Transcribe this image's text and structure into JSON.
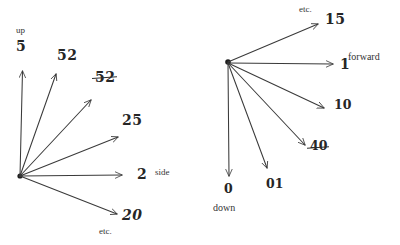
{
  "figure": {
    "background_color": "#ffffff",
    "ink_color": "#2e2e2e",
    "stroke_color": "#3a3a3a"
  },
  "left_diagram": {
    "name": "side-up-fan",
    "origin_label_up": "up",
    "origin_label_side": "side",
    "etc_label": "etc.",
    "axis_labels": {
      "up": "up",
      "side": "side"
    },
    "rays": [
      {
        "id": "ray-up",
        "label": "5",
        "struck": false
      },
      {
        "id": "ray-upper-1",
        "label": "52",
        "struck": false
      },
      {
        "id": "ray-upper-2",
        "label": "52",
        "struck": true
      },
      {
        "id": "ray-mid",
        "label": "25",
        "struck": false
      },
      {
        "id": "ray-side",
        "label": "2",
        "struck": false
      },
      {
        "id": "ray-lower",
        "label": "20",
        "struck": false
      }
    ]
  },
  "right_diagram": {
    "name": "forward-down-fan",
    "etc_label": "etc.",
    "axis_labels": {
      "forward": "forward",
      "down": "down"
    },
    "rays": [
      {
        "id": "ray-up-right",
        "label": "15",
        "struck": false
      },
      {
        "id": "ray-forward",
        "label": "1",
        "struck": false
      },
      {
        "id": "ray-d1",
        "label": "10",
        "struck": false
      },
      {
        "id": "ray-d2",
        "label": "40",
        "struck": true
      },
      {
        "id": "ray-d3",
        "label": "01",
        "struck": false
      },
      {
        "id": "ray-down",
        "label": "0",
        "struck": false
      }
    ]
  }
}
